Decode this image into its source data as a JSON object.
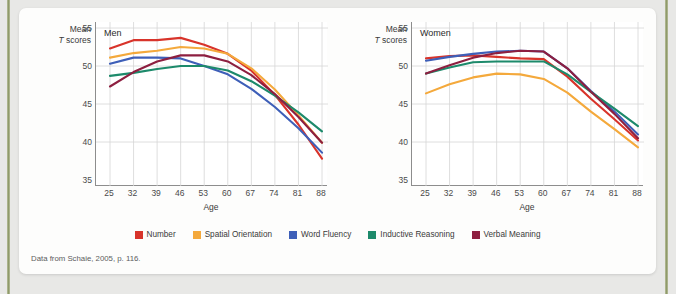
{
  "figure": {
    "source_note": "Data from Schaie, 2005, p. 116.",
    "y_axis_title_line1": "Mean",
    "y_axis_title_line2_italic": "T",
    "y_axis_title_line2_rest": " scores",
    "x_axis_label": "Age"
  },
  "legend": {
    "position": "bottom-center",
    "items": [
      {
        "label": "Number",
        "color": "#d8342b"
      },
      {
        "label": "Spatial Orientation",
        "color": "#f4a93c"
      },
      {
        "label": "Word Fluency",
        "color": "#3e5fb8"
      },
      {
        "label": "Inductive Reasoning",
        "color": "#1d8a6b"
      },
      {
        "label": "Verbal Meaning",
        "color": "#8d1f40"
      }
    ]
  },
  "chart_data": [
    {
      "type": "line",
      "title": "Men",
      "xlabel": "Age",
      "ylabel": "Mean T scores",
      "x": [
        25,
        32,
        39,
        46,
        53,
        60,
        67,
        74,
        81,
        88
      ],
      "xlim": [
        25,
        88
      ],
      "ylim": [
        35,
        55
      ],
      "yticks": [
        35,
        40,
        45,
        50,
        55
      ],
      "grid": true,
      "series": [
        {
          "name": "Number",
          "color": "#d8342b",
          "values": [
            52.3,
            53.4,
            53.4,
            53.7,
            52.8,
            51.6,
            49.4,
            46.2,
            42.3,
            37.8
          ]
        },
        {
          "name": "Spatial Orientation",
          "color": "#f4a93c",
          "values": [
            51.1,
            51.7,
            52.0,
            52.5,
            52.3,
            51.6,
            49.7,
            46.9,
            43.5,
            39.9
          ]
        },
        {
          "name": "Word Fluency",
          "color": "#3e5fb8",
          "values": [
            50.3,
            51.1,
            51.1,
            51.0,
            50.0,
            48.9,
            47.0,
            44.6,
            41.8,
            38.6
          ]
        },
        {
          "name": "Inductive Reasoning",
          "color": "#1d8a6b",
          "values": [
            48.7,
            49.1,
            49.6,
            50.0,
            50.0,
            49.4,
            48.0,
            46.1,
            43.9,
            41.4
          ]
        },
        {
          "name": "Verbal Meaning",
          "color": "#8d1f40",
          "values": [
            47.3,
            49.2,
            50.6,
            51.4,
            51.4,
            50.6,
            48.8,
            46.3,
            43.3,
            39.9
          ]
        }
      ]
    },
    {
      "type": "line",
      "title": "Women",
      "xlabel": "Age",
      "ylabel": "Mean T scores",
      "x": [
        25,
        32,
        39,
        46,
        53,
        60,
        67,
        74,
        81,
        88
      ],
      "xlim": [
        25,
        88
      ],
      "ylim": [
        35,
        55
      ],
      "yticks": [
        35,
        40,
        45,
        50,
        55
      ],
      "grid": true,
      "series": [
        {
          "name": "Number",
          "color": "#d8342b",
          "values": [
            51.0,
            51.3,
            51.4,
            51.2,
            51.0,
            50.9,
            48.6,
            45.7,
            43.0,
            40.2
          ]
        },
        {
          "name": "Spatial Orientation",
          "color": "#f4a93c",
          "values": [
            46.4,
            47.6,
            48.5,
            49.0,
            48.9,
            48.3,
            46.5,
            44.0,
            41.7,
            39.3
          ]
        },
        {
          "name": "Word Fluency",
          "color": "#3e5fb8",
          "values": [
            50.7,
            51.2,
            51.6,
            51.9,
            52.0,
            51.9,
            49.7,
            46.7,
            44.0,
            41.0
          ]
        },
        {
          "name": "Inductive Reasoning",
          "color": "#1d8a6b",
          "values": [
            49.0,
            49.8,
            50.5,
            50.6,
            50.6,
            50.6,
            48.9,
            46.6,
            44.4,
            42.1
          ]
        },
        {
          "name": "Verbal Meaning",
          "color": "#8d1f40",
          "values": [
            49.0,
            50.1,
            51.1,
            51.7,
            52.0,
            51.9,
            49.7,
            46.6,
            43.7,
            40.5
          ]
        }
      ]
    }
  ]
}
